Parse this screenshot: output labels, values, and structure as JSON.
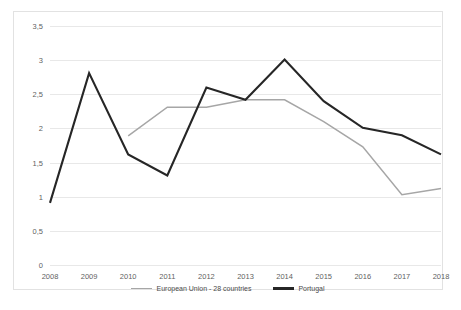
{
  "chart_data": {
    "type": "line",
    "title": "",
    "subtitle": "",
    "xlabel": "",
    "ylabel": "",
    "categories": [
      "2008",
      "2009",
      "2010",
      "2011",
      "2012",
      "2013",
      "2014",
      "2015",
      "2016",
      "2017",
      "2018"
    ],
    "ylim": [
      0,
      3.5
    ],
    "yticks": [
      "0",
      "0,5",
      "1",
      "1,5",
      "2",
      "2,5",
      "3",
      "3,5"
    ],
    "ytick_values": [
      0,
      0.5,
      1,
      1.5,
      2,
      2.5,
      3,
      3.5
    ],
    "grid": "horizontal",
    "legend_position": "bottom",
    "decimal_separator": ",",
    "series": [
      {
        "name": "European Union - 28 countries",
        "color": "#a6a6a6",
        "values": [
          null,
          null,
          1.89,
          2.31,
          2.31,
          2.42,
          2.42,
          2.1,
          1.73,
          1.03,
          1.12
        ]
      },
      {
        "name": "Portugal",
        "color": "#262626",
        "values": [
          0.91,
          2.81,
          1.62,
          1.31,
          2.6,
          2.42,
          3.01,
          2.4,
          2.01,
          1.9,
          1.62
        ]
      }
    ]
  },
  "legend": {
    "items": [
      {
        "label": "European Union - 28 countries",
        "color": "#a6a6a6"
      },
      {
        "label": "Portugal",
        "color": "#262626"
      }
    ]
  }
}
